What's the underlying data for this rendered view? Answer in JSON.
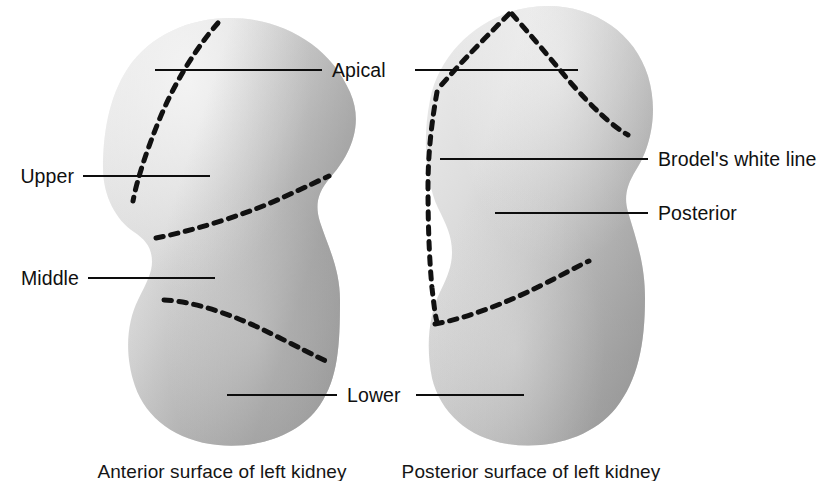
{
  "figure": {
    "background_color": "#ffffff",
    "width": 826,
    "height": 481
  },
  "colors": {
    "outline_dash": "#111111",
    "leader_line": "#0d0d0d",
    "text": "#101010",
    "kidney_light": "#e2e2e2",
    "kidney_mid": "#c9c9c9",
    "kidney_dark": "#a3a3a3"
  },
  "labels": {
    "apical": "Apical",
    "upper": "Upper",
    "middle": "Middle",
    "lower": "Lower",
    "brodels_white_line": "Brodel's white line",
    "posterior": "Posterior"
  },
  "captions": {
    "left": "Anterior surface of left kidney",
    "right": "Posterior surface of left kidney"
  },
  "diagrams": [
    {
      "name": "anterior-surface-left-kidney",
      "caption": "Anterior surface of left kidney",
      "hilum_side": "left",
      "segments": [
        "Apical",
        "Upper",
        "Middle",
        "Lower"
      ]
    },
    {
      "name": "posterior-surface-left-kidney",
      "caption": "Posterior surface of left kidney",
      "hilum_side": "right",
      "segments": [
        "Apical",
        "Brodel's white line",
        "Posterior",
        "Lower"
      ]
    }
  ]
}
